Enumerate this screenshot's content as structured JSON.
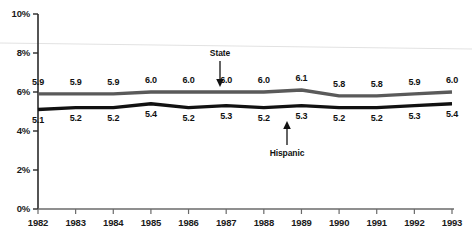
{
  "chart_data": {
    "type": "line",
    "title": "",
    "xlabel": "",
    "ylabel": "",
    "categories": [
      "1982",
      "1983",
      "1984",
      "1985",
      "1986",
      "1987",
      "1988",
      "1989",
      "1990",
      "1991",
      "1992",
      "1993"
    ],
    "x_tick_labels": [
      "1982",
      "1983",
      "1984",
      "1985",
      "1986",
      "1987",
      "1988",
      "1989",
      "1990",
      "1991",
      "1992",
      "1993"
    ],
    "y_tick_labels": [
      "0%",
      "2%",
      "4%",
      "6%",
      "8%",
      "10%"
    ],
    "y_tick_values": [
      0,
      2,
      4,
      6,
      8,
      10
    ],
    "ylim": [
      0,
      10
    ],
    "grid": false,
    "legend_position": "inline-annotations",
    "series": [
      {
        "name": "State",
        "color": "#5a5a5a",
        "label_position": "above",
        "values": [
          5.9,
          5.9,
          5.9,
          6.0,
          6.0,
          6.0,
          6.0,
          6.1,
          5.8,
          5.8,
          5.9,
          6.0
        ],
        "value_labels": [
          "5.9",
          "5.9",
          "5.9",
          "6.0",
          "6.0",
          "6.0",
          "6.0",
          "6.1",
          "5.8",
          "5.8",
          "5.9",
          "6.0"
        ]
      },
      {
        "name": "Hispanic",
        "color": "#111111",
        "label_position": "below",
        "values": [
          5.1,
          5.2,
          5.2,
          5.4,
          5.2,
          5.3,
          5.2,
          5.3,
          5.2,
          5.2,
          5.3,
          5.4
        ],
        "value_labels": [
          "5.1",
          "5.2",
          "5.2",
          "5.4",
          "5.2",
          "5.3",
          "5.2",
          "5.3",
          "5.2",
          "5.2",
          "5.3",
          "5.4"
        ]
      }
    ],
    "annotations": [
      {
        "text": "State",
        "points_to": "state-line",
        "arrow": "down",
        "at_category": "1987"
      },
      {
        "text": "Hispanic",
        "points_to": "hispanic-line",
        "arrow": "up",
        "at_category": "1989"
      }
    ]
  }
}
